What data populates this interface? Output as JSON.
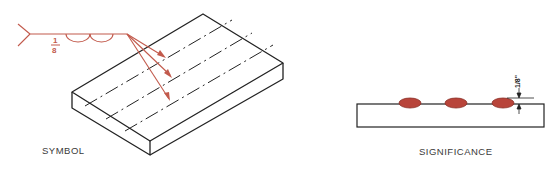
{
  "colors": {
    "symbol_red": "#c25a4c",
    "bead_fill": "#b8443a",
    "bead_outline": "#8a2e26",
    "line_black": "#222222"
  },
  "symbol_panel": {
    "label": "SYMBOL",
    "weld_symbol": {
      "size_fraction": {
        "numerator": "1",
        "denominator": "8"
      },
      "type": "surfacing weld (two semicircles)",
      "arrows": 3
    },
    "plate": "isometric plate with three dash-dot weld centerlines"
  },
  "significance_panel": {
    "label": "SIGNIFICANCE",
    "dimension": "1/8\"",
    "beads": 3
  }
}
